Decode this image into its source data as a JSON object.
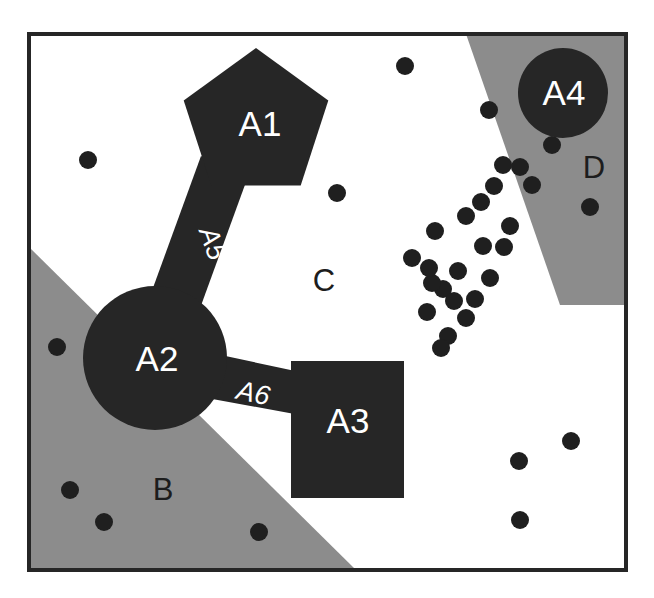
{
  "figure": {
    "canvas": {
      "width": 654,
      "height": 598
    },
    "frame": {
      "x": 27,
      "y": 32,
      "width": 601,
      "height": 540,
      "stroke_color": "#262626",
      "stroke_width": 4
    },
    "background_color": "#ffffff"
  },
  "colors": {
    "entity_fill": "#262626",
    "region_gray_fill": "#8c8c8c",
    "region_white_fill": "#ffffff",
    "point_fill": "#1f1f1f",
    "label_dark": "#1d1d1d",
    "label_light": "#ffffff",
    "frame_stroke": "#262626"
  },
  "regions": [
    {
      "id": "B",
      "label": "B",
      "fill": "#8c8c8c",
      "label_x": 163,
      "label_y": 492,
      "polygon": "29,247 29,570 356,570",
      "description": "lower-left gray wedge"
    },
    {
      "id": "C",
      "label": "C",
      "fill": "#ffffff",
      "label_x": 324,
      "label_y": 283,
      "polygon": "29,34 466,34 560,305 626,305 626,570 356,570 29,247",
      "description": "central white region"
    },
    {
      "id": "D",
      "label": "D",
      "fill": "#8c8c8c",
      "label_x": 594,
      "label_y": 170,
      "polygon": "466,34 626,34 626,305 560,305",
      "description": "upper-right gray wedge"
    }
  ],
  "entities": [
    {
      "id": "A1",
      "label": "A1",
      "shape": "pentagon",
      "fill": "#262626",
      "center_x": 256,
      "center_y": 124,
      "radius": 76,
      "label_x": 260,
      "label_y": 127
    },
    {
      "id": "A2",
      "label": "A2",
      "shape": "circle",
      "fill": "#262626",
      "center_x": 155,
      "center_y": 358,
      "radius": 72,
      "label_x": 157,
      "label_y": 362
    },
    {
      "id": "A3",
      "label": "A3",
      "shape": "rectangle",
      "fill": "#262626",
      "x": 291,
      "y": 361,
      "width": 113,
      "height": 137,
      "label_x": 348,
      "label_y": 424
    },
    {
      "id": "A4",
      "label": "A4",
      "shape": "circle",
      "fill": "#262626",
      "center_x": 563,
      "center_y": 93,
      "radius": 45,
      "label_x": 564,
      "label_y": 96
    }
  ],
  "edges": [
    {
      "id": "A5",
      "label": "A5",
      "from": "A1",
      "to": "A2",
      "fill": "#262626",
      "polygon": "201,156 246,182 179,366 134,340",
      "label_x": 211,
      "label_y": 244,
      "label_rotation": 70
    },
    {
      "id": "A6",
      "label": "A6",
      "from": "A2",
      "to": "A3",
      "fill": "#262626",
      "polygon": "188,348 300,372 300,415 196,396",
      "label_x": 253,
      "label_y": 395,
      "label_rotation": 12
    }
  ],
  "points": {
    "radius": 9,
    "fill": "#1f1f1f",
    "count": 35,
    "coordinates": [
      [
        88,
        160
      ],
      [
        337,
        193
      ],
      [
        405,
        66
      ],
      [
        57,
        347
      ],
      [
        70,
        490
      ],
      [
        104,
        522
      ],
      [
        259,
        532
      ],
      [
        489,
        110
      ],
      [
        552,
        145
      ],
      [
        503,
        165
      ],
      [
        520,
        167
      ],
      [
        590,
        207
      ],
      [
        494,
        186
      ],
      [
        466,
        216
      ],
      [
        510,
        226
      ],
      [
        483,
        246
      ],
      [
        435,
        231
      ],
      [
        458,
        271
      ],
      [
        490,
        278
      ],
      [
        443,
        289
      ],
      [
        427,
        312
      ],
      [
        466,
        318
      ],
      [
        448,
        336
      ],
      [
        432,
        283
      ],
      [
        475,
        299
      ],
      [
        504,
        247
      ],
      [
        519,
        461
      ],
      [
        571,
        441
      ],
      [
        520,
        520
      ],
      [
        429,
        268
      ],
      [
        454,
        301
      ],
      [
        481,
        202
      ],
      [
        532,
        185
      ],
      [
        412,
        258
      ],
      [
        441,
        348
      ]
    ]
  }
}
